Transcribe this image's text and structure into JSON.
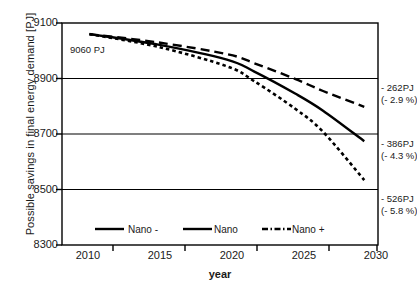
{
  "chart_data": {
    "type": "line",
    "title": "",
    "xlabel": "year",
    "ylabel": "Possible savings in final energy demand [PJ]",
    "xlim": [
      2008,
      2031
    ],
    "ylim": [
      8300,
      9100
    ],
    "xticks": [
      "2010",
      "2015",
      "2020",
      "2025",
      "2030"
    ],
    "xtick_values": [
      2010,
      2015,
      2020,
      2025,
      2030
    ],
    "yticks": [
      "8300",
      "8500",
      "8700",
      "8900",
      "9100"
    ],
    "ytick_values": [
      8300,
      8500,
      8700,
      8900,
      9100
    ],
    "grid": "horizontal",
    "legend_position": "inside-bottom",
    "x": [
      2010,
      2015,
      2020,
      2022,
      2025,
      2027,
      2030
    ],
    "series": [
      {
        "name": "Nano -",
        "style": "dashed",
        "values": [
          9060,
          9030,
          8988,
          8955,
          8898,
          8855,
          8798
        ],
        "end_value": 8798
      },
      {
        "name": "Nano",
        "style": "solid",
        "values": [
          9060,
          9022,
          8968,
          8925,
          8845,
          8784,
          8674
        ],
        "end_value": 8674
      },
      {
        "name": "Nano +",
        "style": "dotted",
        "values": [
          9060,
          9014,
          8944,
          8890,
          8790,
          8708,
          8534
        ],
        "end_value": 8534
      }
    ],
    "annotations": [
      {
        "id": "start-value",
        "text": "9060 PJ",
        "x": 2010,
        "y": 8985
      },
      {
        "id": "nano-minus-end",
        "line1": "- 262PJ",
        "line2": "(- 2.9 %)",
        "pj": -262,
        "percent": -2.9
      },
      {
        "id": "nano-end",
        "line1": "- 386PJ",
        "line2": "(- 4.3 %)",
        "pj": -386,
        "percent": -4.3
      },
      {
        "id": "nano-plus-end",
        "line1": "- 526PJ",
        "line2": "(- 5.8 %)",
        "pj": -526,
        "percent": -5.8
      }
    ],
    "colors": {
      "line": "#000000",
      "axis": "#000000",
      "grid": "#000000",
      "background": "#ffffff"
    }
  },
  "legend": {
    "items": [
      {
        "label": "Nano -",
        "style": "solid"
      },
      {
        "label": "Nano",
        "style": "solid"
      },
      {
        "label": "Nano +",
        "style": "dash-dot"
      }
    ]
  }
}
